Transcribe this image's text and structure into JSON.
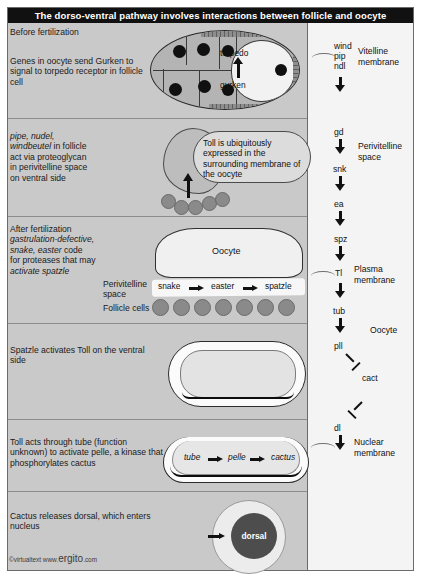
{
  "title": "The dorso-ventral pathway involves interactions between follicle and oocyte",
  "panels": [
    {
      "id": "before-fertilization",
      "heading": "Before fertilization",
      "body": "Genes in oocyte send Gurken to signal to torpedo receptor in follicle cell",
      "diagram_labels": {
        "receptor": "torpedo",
        "ligand": "gurken"
      }
    },
    {
      "id": "pipe-nudel-windbeutel",
      "text_parts": [
        {
          "text": "pipe, nudel,",
          "italic": true
        },
        {
          "text": "windbeutel",
          "italic": true
        },
        {
          "text": " in follicle",
          "italic": false
        },
        {
          "text": "act via proteoglycan",
          "italic": false
        },
        {
          "text": "in perivitelline space",
          "italic": false
        },
        {
          "text": "on ventral side",
          "italic": false
        }
      ],
      "callout": "Toll is ubiquitously expressed in the surrounding membrane of the oocyte"
    },
    {
      "id": "after-fertilization",
      "heading": "After fertilization",
      "text_parts": [
        {
          "text": "gastrulation-defective,",
          "italic": true
        },
        {
          "text": "snake, easter",
          "italic": true
        },
        {
          "text": " code",
          "italic": false
        },
        {
          "text": "for proteases that may",
          "italic": false
        },
        {
          "text": "activate spatzle",
          "italic": true
        }
      ],
      "oocyte_label": "Oocyte",
      "space_label_line1": "Perivitelline",
      "space_label_line2": "space",
      "follicle_label": "Follicle cells",
      "protease_cascade": [
        "snake",
        "easter",
        "spatzle"
      ]
    },
    {
      "id": "spatzle-activates-toll",
      "body": "Spatzle activates Toll on the ventral side"
    },
    {
      "id": "toll-tube-pelle",
      "body": "Toll acts through tube (function unknown) to activate pelle, a kinase that phosphorylates cactus",
      "kinase_cascade": [
        "tube",
        "pelle",
        "cactus"
      ]
    },
    {
      "id": "cactus-releases-dorsal",
      "body": "Cactus releases dorsal, which enters nucleus",
      "nucleus_label": "dorsal"
    }
  ],
  "pathway": {
    "nodes": [
      "wind",
      "pip",
      "ndl",
      "gd",
      "snk",
      "ea",
      "spz",
      "Tl",
      "tub",
      "pll",
      "cact",
      "dl"
    ],
    "compartments": [
      {
        "label_line1": "Vitelline",
        "label_line2": "membrane"
      },
      {
        "label_line1": "Perivitelline",
        "label_line2": "space"
      },
      {
        "label_line1": "Plasma",
        "label_line2": "membrane"
      },
      {
        "label_line1": "Oocyte",
        "label_line2": ""
      },
      {
        "label_line1": "Nuclear",
        "label_line2": "membrane"
      }
    ]
  },
  "footer": {
    "copyright": "©virtualtext",
    "www": "www.",
    "brand": "ergito",
    "tld": ".com"
  },
  "colors": {
    "panel_bg": "#c9c9c9",
    "right_col_bg": "#f4f4f4",
    "title_bg": "#111111",
    "title_fg": "#ffffff",
    "nucleus": "#4d4d4d",
    "follicle_cell": "#8a8a8a"
  }
}
